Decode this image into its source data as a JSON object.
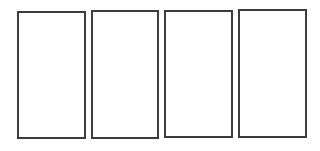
{
  "diagram": {
    "border_color": "#3c3c3c",
    "background_color": "#ffffff",
    "panels": [
      {
        "id": "panel-1",
        "label": "",
        "x": 17,
        "y": 11,
        "width": 69,
        "height": 128
      },
      {
        "id": "panel-2",
        "label": "",
        "x": 91,
        "y": 10,
        "width": 68,
        "height": 129
      },
      {
        "id": "panel-3",
        "label": "",
        "x": 164,
        "y": 10,
        "width": 69,
        "height": 128
      },
      {
        "id": "panel-4",
        "label": "",
        "x": 238,
        "y": 9,
        "width": 69,
        "height": 129
      }
    ]
  }
}
